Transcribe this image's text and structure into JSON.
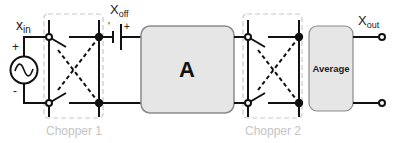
{
  "diagram": {
    "labels": {
      "x_in": {
        "main": "x",
        "sub": "in"
      },
      "x_off": {
        "main": "X",
        "sub": "off"
      },
      "x_out": {
        "main": "X",
        "sub": "out"
      },
      "source_plus": "+",
      "source_minus": "-",
      "battery_minus": "'",
      "battery_plus": "+"
    },
    "blocks": {
      "amplifier": "A",
      "average": "Average"
    },
    "groups": {
      "chopper1": "Chopper 1",
      "chopper2": "Chopper 2"
    },
    "colors": {
      "wire": "#111111",
      "block_fill": "#e6e6e6",
      "block_stroke": "#8a8a8a",
      "dashed_box": "#c8c8c8",
      "group_label": "#c4c4c4"
    }
  }
}
